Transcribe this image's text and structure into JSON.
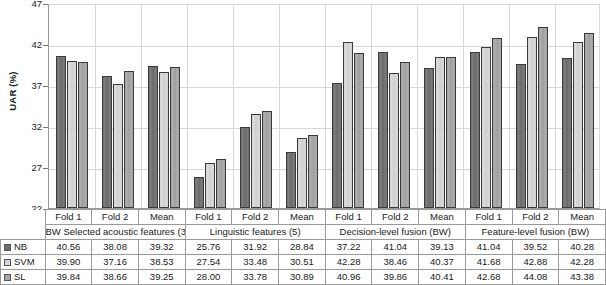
{
  "chart_data": {
    "type": "bar",
    "title": "",
    "xlabel": "",
    "ylabel": "UAR (%)",
    "ylim": [
      22,
      47
    ],
    "yticks": [
      22,
      27,
      32,
      37,
      42,
      47
    ],
    "grid": true,
    "legend_position": "table-row-headers",
    "groups": [
      {
        "name": "BW Selected acoustic features (305)",
        "folds": [
          "Fold 1",
          "Fold 2",
          "Mean"
        ]
      },
      {
        "name": "Linguistic features (5)",
        "folds": [
          "Fold 1",
          "Fold 2",
          "Mean"
        ]
      },
      {
        "name": "Decision-level fusion (BW)",
        "folds": [
          "Fold 1",
          "Fold 2",
          "Mean"
        ]
      },
      {
        "name": "Feature-level fusion (BW)",
        "folds": [
          "Fold 1",
          "Fold 2",
          "Mean"
        ]
      }
    ],
    "categories": [
      "Fold 1",
      "Fold 2",
      "Mean",
      "Fold 1",
      "Fold 2",
      "Mean",
      "Fold 1",
      "Fold 2",
      "Mean",
      "Fold 1",
      "Fold 2",
      "Mean"
    ],
    "series": [
      {
        "name": "NB",
        "color": "#6f6f6f",
        "values": [
          40.56,
          38.08,
          39.32,
          25.76,
          31.92,
          28.84,
          37.22,
          41.04,
          39.13,
          41.04,
          39.52,
          40.28
        ]
      },
      {
        "name": "SVM",
        "color": "#d6d6d6",
        "values": [
          39.9,
          37.16,
          38.53,
          27.54,
          33.48,
          30.51,
          42.28,
          38.46,
          40.37,
          41.68,
          42.88,
          42.28
        ]
      },
      {
        "name": "SL",
        "color": "#a5a5a5",
        "values": [
          39.84,
          38.66,
          39.25,
          28.0,
          33.78,
          30.89,
          40.96,
          39.86,
          40.41,
          42.68,
          44.08,
          43.38
        ]
      }
    ]
  },
  "axis": {
    "ylabel": "UAR (%)",
    "ticks": [
      "47",
      "42",
      "37",
      "32",
      "27",
      "22"
    ]
  },
  "table": {
    "fold_labels": [
      "Fold 1",
      "Fold 2",
      "Mean",
      "Fold 1",
      "Fold 2",
      "Mean",
      "Fold 1",
      "Fold 2",
      "Mean",
      "Fold 1",
      "Fold 2",
      "Mean"
    ],
    "group_labels": [
      "BW Selected acoustic features (305)",
      "Linguistic features (5)",
      "Decision-level fusion (BW)",
      "Feature-level fusion (BW)"
    ],
    "rows": [
      {
        "label": "NB",
        "values": [
          "40.56",
          "38.08",
          "39.32",
          "25.76",
          "31.92",
          "28.84",
          "37.22",
          "41.04",
          "39.13",
          "41.04",
          "39.52",
          "40.28"
        ]
      },
      {
        "label": "SVM",
        "values": [
          "39.90",
          "37.16",
          "38.53",
          "27.54",
          "33.48",
          "30.51",
          "42.28",
          "38.46",
          "40.37",
          "41.68",
          "42.88",
          "42.28"
        ]
      },
      {
        "label": "SL",
        "values": [
          "39.84",
          "38.66",
          "39.25",
          "28.00",
          "33.78",
          "30.89",
          "40.96",
          "39.86",
          "40.41",
          "42.68",
          "44.08",
          "43.38"
        ]
      }
    ]
  }
}
